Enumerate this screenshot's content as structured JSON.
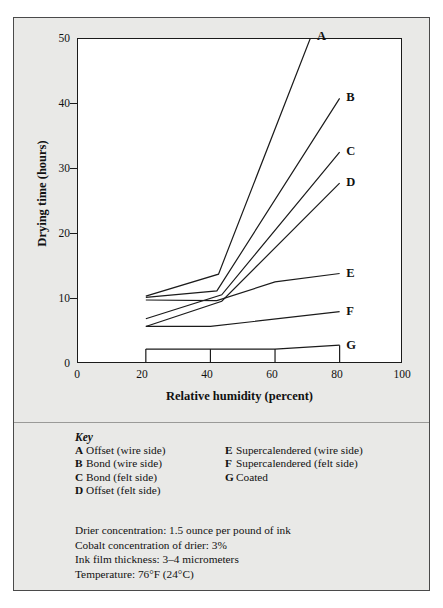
{
  "chart_data": {
    "type": "line",
    "title": "",
    "xlabel": "Relative humidity (percent)",
    "ylabel": "Drying time (hours)",
    "xlim": [
      0,
      100
    ],
    "ylim": [
      0,
      50
    ],
    "xticks": [
      0,
      20,
      40,
      60,
      80,
      100
    ],
    "yticks": [
      0,
      10,
      20,
      30,
      40,
      50
    ],
    "grid": false,
    "legend_position": "right-endpoint-labels",
    "series": [
      {
        "name": "A",
        "label": "Offset (wire side)",
        "x": [
          21,
          43.5,
          72
        ],
        "values": [
          10.2,
          13.6,
          50.2
        ]
      },
      {
        "name": "B",
        "label": "Bond (wire side)",
        "x": [
          21,
          43,
          81
        ],
        "values": [
          10.0,
          11.0,
          40.8
        ]
      },
      {
        "name": "C",
        "label": "Bond (felt side)",
        "x": [
          21,
          44.5,
          81
        ],
        "values": [
          6.7,
          10.4,
          32.5
        ]
      },
      {
        "name": "D",
        "label": "Offset (felt side)",
        "x": [
          21,
          44.5,
          81
        ],
        "values": [
          5.5,
          9.4,
          27.7
        ]
      },
      {
        "name": "E",
        "label": "Supercalendered (wire side)",
        "x": [
          21,
          43,
          61,
          81
        ],
        "values": [
          9.6,
          9.5,
          12.4,
          13.7
        ]
      },
      {
        "name": "F",
        "label": "Supercalendered (felt side)",
        "x": [
          21,
          41,
          81
        ],
        "values": [
          5.5,
          5.5,
          7.8
        ]
      },
      {
        "name": "G",
        "label": "Coated",
        "x": [
          21,
          41,
          61,
          81
        ],
        "values": [
          2.0,
          2.0,
          2.0,
          2.6
        ]
      }
    ]
  },
  "key": {
    "title": "Key",
    "column_left": [
      {
        "letter": "A",
        "text": "Offset (wire side)"
      },
      {
        "letter": "B",
        "text": "Bond (wire side)"
      },
      {
        "letter": "C",
        "text": "Bond (felt side)"
      },
      {
        "letter": "D",
        "text": "Offset (felt side)"
      }
    ],
    "column_right": [
      {
        "letter": "E",
        "text": "Supercalendered (wire side)"
      },
      {
        "letter": "F",
        "text": "Supercalendered (felt side)"
      },
      {
        "letter": "G",
        "text": "Coated"
      }
    ]
  },
  "notes": [
    "Drier concentration: 1.5 ounce per pound of ink",
    "Cobalt concentration of drier: 3%",
    "Ink film thickness: 3–4 micrometers",
    "Temperature: 76°F (24°C)"
  ],
  "colors": {
    "figure_background": "#e9e9e7",
    "plot_background": "#ffffff",
    "line": "#1b1b1b",
    "text": "#111111",
    "border": "#4a4a4a"
  }
}
